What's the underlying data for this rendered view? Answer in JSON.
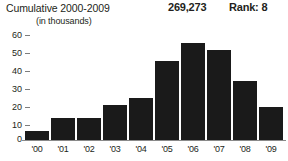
{
  "header": {
    "title": "Cumulative 2000-2009",
    "total_value": "269,273",
    "rank_label": "Rank: 8",
    "units_note": "(in thousands)"
  },
  "chart_data": {
    "type": "bar",
    "title": "Cumulative 2000-2009",
    "subtitle": "(in thousands)",
    "categories": [
      "'00",
      "'01",
      "'02",
      "'03",
      "'04",
      "'05",
      "'06",
      "'07",
      "'08",
      "'09"
    ],
    "values": [
      5,
      12,
      12,
      19,
      23,
      43,
      53,
      49,
      32,
      18
    ],
    "xlabel": "",
    "ylabel": "",
    "ylim": [
      0,
      60
    ],
    "yticks": [
      60,
      50,
      40,
      30,
      20,
      10,
      0
    ],
    "grid": false,
    "legend": false,
    "bar_color": "#1a1a1a",
    "total": "269,273",
    "rank": "Rank: 8"
  }
}
